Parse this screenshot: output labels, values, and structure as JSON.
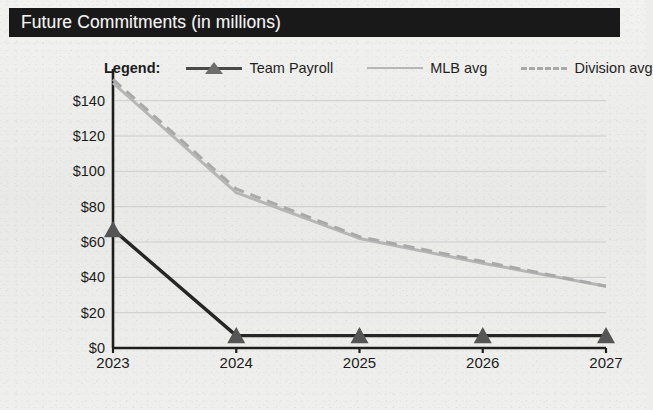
{
  "title": "Future Commitments (in millions)",
  "legend": {
    "label": "Legend:",
    "entries": [
      {
        "name": "Team Payroll",
        "marker": "triangle-line",
        "color": "#3a3a3a"
      },
      {
        "name": "MLB avg",
        "marker": "solid-line",
        "color": "#b6b6b6"
      },
      {
        "name": "Division avg",
        "marker": "dashed-line",
        "color": "#a9a9a9"
      }
    ]
  },
  "chart_data": {
    "type": "line",
    "title": "Future Commitments (in millions)",
    "xlabel": "",
    "ylabel": "",
    "categories": [
      "2023",
      "2024",
      "2025",
      "2026",
      "2027"
    ],
    "x": [
      2023,
      2024,
      2025,
      2026,
      2027
    ],
    "ylim": [
      0,
      150
    ],
    "yticks": [
      0,
      20,
      40,
      60,
      80,
      100,
      120,
      140
    ],
    "ytick_labels": [
      "$0",
      "$20",
      "$40",
      "$60",
      "$80",
      "$100",
      "$120",
      "$140"
    ],
    "grid": true,
    "legend_position": "top",
    "series": [
      {
        "name": "Team Payroll",
        "values": [
          67,
          7,
          7,
          7,
          7
        ],
        "color": "#262626",
        "style": "solid",
        "marker": "triangle"
      },
      {
        "name": "MLB avg",
        "values": [
          150,
          88,
          62,
          48,
          35
        ],
        "color": "#b6b6b6",
        "style": "solid",
        "marker": "none"
      },
      {
        "name": "Division avg",
        "values": [
          152,
          90,
          63,
          49,
          35
        ],
        "color": "#a9a9a9",
        "style": "dashed",
        "marker": "none"
      }
    ]
  }
}
